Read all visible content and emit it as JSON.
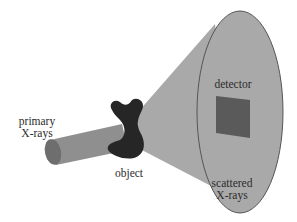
{
  "diagram": {
    "title": "",
    "labels": {
      "primary_line1": "primary",
      "primary_line2": "X-rays",
      "object": "object",
      "detector": "detector",
      "scattered_line1": "scattered",
      "scattered_line2": "X-rays"
    },
    "components": [
      {
        "id": "beam",
        "label": "primary X-rays",
        "shape": "cylinder"
      },
      {
        "id": "object",
        "label": "object",
        "shape": "blob"
      },
      {
        "id": "cone",
        "label": "scattered X-rays",
        "shape": "cone"
      },
      {
        "id": "detector",
        "label": "detector",
        "shape": "square"
      }
    ],
    "colors": {
      "cone_fill": "#a9a9a9",
      "cone_edge": "#555555",
      "beam_fill": "#8f8f8f",
      "beam_end": "#6e6e6e",
      "object_fill": "#262626",
      "detector_fill": "#5a5a5a",
      "text": "#2b2b2b"
    }
  }
}
